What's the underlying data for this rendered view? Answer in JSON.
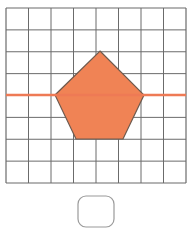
{
  "figure": {
    "background_color": "#ffffff",
    "canvas": {
      "width": 192,
      "height": 231
    }
  },
  "grid": {
    "name": "square-grid",
    "columns": 8,
    "rows": 8,
    "x": 6,
    "y": 8,
    "width": 180,
    "height": 175,
    "cell_width": 22.5,
    "cell_height": 21.875,
    "line_color": "#6b6b6b",
    "line_width": 1,
    "border_color": "#6b6b6b",
    "border_width": 1.2,
    "grid_visible": true
  },
  "symmetry_line": {
    "name": "horizontal-symmetry-line",
    "orientation": "horizontal",
    "x1": 6,
    "y1": 95,
    "x2": 186,
    "y2": 95,
    "color": "#ee7a55",
    "width": 2.4,
    "spans_full_grid": true
  },
  "pentagon": {
    "name": "orange-pentagon",
    "sides": 5,
    "fill_color": "#f08355",
    "stroke_color": "#6e5a4e",
    "stroke_width": 1.2,
    "points_px": "100,51 144,95 123,139 76,139 55,95",
    "vertices": [
      {
        "label": "apex",
        "x": 100,
        "y": 51
      },
      {
        "label": "right",
        "x": 144,
        "y": 95
      },
      {
        "label": "bottom-right",
        "x": 123,
        "y": 139
      },
      {
        "label": "bottom-left",
        "x": 76,
        "y": 139
      },
      {
        "label": "left",
        "x": 55,
        "y": 95
      }
    ]
  },
  "answer_box": {
    "name": "answer-input-box",
    "x": 78,
    "y": 196,
    "width": 36,
    "height": 31,
    "corner_radius": 8,
    "fill_color": "#ffffff",
    "stroke_color": "#9a9a9a",
    "stroke_width": 1.2,
    "value": "",
    "placeholder": ""
  }
}
